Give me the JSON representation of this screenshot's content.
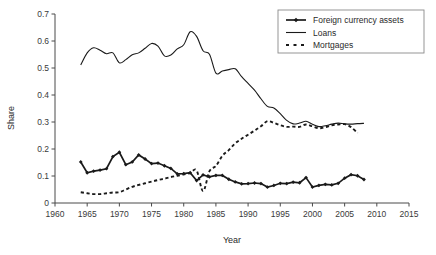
{
  "chart_data": {
    "type": "line",
    "title": "",
    "xlabel": "Year",
    "ylabel": "Share",
    "xlim": [
      1960,
      2015
    ],
    "ylim": [
      0,
      0.7
    ],
    "xticks": [
      1960,
      1965,
      1970,
      1975,
      1980,
      1985,
      1990,
      1995,
      2000,
      2005,
      2010,
      2015
    ],
    "xtick_labels": [
      "1960",
      "1965",
      "1970",
      "1975",
      "1980",
      "1985",
      "1990",
      "1995",
      "2000",
      "2005",
      "2010",
      "2015"
    ],
    "yticks": [
      0,
      0.1,
      0.2,
      0.3,
      0.4,
      0.5,
      0.6,
      0.7
    ],
    "ytick_labels": [
      "0",
      "0.1",
      "0.2",
      "0.3",
      "0.4",
      "0.5",
      "0.6",
      "0.7"
    ],
    "grid": false,
    "legend_position": "top-right",
    "series": [
      {
        "name": "Foreign currency assets",
        "style": "solid-with-markers",
        "marker": "diamond",
        "color": "#1a1a1a",
        "x": [
          1964,
          1965,
          1966,
          1967,
          1968,
          1969,
          1970,
          1971,
          1972,
          1973,
          1974,
          1975,
          1976,
          1977,
          1978,
          1979,
          1980,
          1981,
          1982,
          1983,
          1984,
          1985,
          1986,
          1987,
          1988,
          1989,
          1990,
          1991,
          1992,
          1993,
          1994,
          1995,
          1996,
          1997,
          1998,
          1999,
          2000,
          2001,
          2002,
          2003,
          2004,
          2005,
          2006,
          2007,
          2008
        ],
        "y": [
          0.152,
          0.112,
          0.118,
          0.122,
          0.127,
          0.172,
          0.188,
          0.142,
          0.152,
          0.178,
          0.163,
          0.146,
          0.148,
          0.138,
          0.128,
          0.108,
          0.109,
          0.112,
          0.083,
          0.104,
          0.097,
          0.102,
          0.102,
          0.088,
          0.078,
          0.071,
          0.072,
          0.074,
          0.072,
          0.059,
          0.065,
          0.073,
          0.072,
          0.077,
          0.075,
          0.094,
          0.059,
          0.065,
          0.069,
          0.067,
          0.073,
          0.092,
          0.105,
          0.101,
          0.087
        ]
      },
      {
        "name": "Loans",
        "style": "solid",
        "color": "#1a1a1a",
        "x": [
          1964,
          1965,
          1966,
          1967,
          1968,
          1969,
          1970,
          1971,
          1972,
          1973,
          1974,
          1975,
          1976,
          1977,
          1978,
          1979,
          1980,
          1981,
          1982,
          1983,
          1984,
          1985,
          1986,
          1987,
          1988,
          1989,
          1990,
          1991,
          1992,
          1993,
          1994,
          1995,
          1996,
          1997,
          1998,
          1999,
          2000,
          2001,
          2002,
          2003,
          2004,
          2005,
          2006,
          2007,
          2008
        ],
        "y": [
          0.511,
          0.556,
          0.575,
          0.566,
          0.553,
          0.556,
          0.519,
          0.531,
          0.549,
          0.556,
          0.573,
          0.591,
          0.581,
          0.545,
          0.548,
          0.571,
          0.586,
          0.634,
          0.617,
          0.564,
          0.551,
          0.481,
          0.489,
          0.494,
          0.497,
          0.468,
          0.443,
          0.418,
          0.386,
          0.358,
          0.352,
          0.331,
          0.306,
          0.293,
          0.296,
          0.303,
          0.292,
          0.283,
          0.286,
          0.292,
          0.296,
          0.293,
          0.292,
          0.294,
          0.295
        ]
      },
      {
        "name": "Mortgages",
        "style": "dashed",
        "color": "#1a1a1a",
        "x": [
          1964,
          1965,
          1966,
          1967,
          1968,
          1969,
          1970,
          1971,
          1972,
          1973,
          1974,
          1975,
          1976,
          1977,
          1978,
          1979,
          1980,
          1981,
          1982,
          1983,
          1984,
          1985,
          1986,
          1987,
          1988,
          1989,
          1990,
          1991,
          1992,
          1993,
          1994,
          1995,
          1996,
          1997,
          1998,
          1999,
          2000,
          2001,
          2002,
          2003,
          2004,
          2005,
          2006,
          2007
        ],
        "y": [
          0.04,
          0.036,
          0.033,
          0.033,
          0.036,
          0.039,
          0.04,
          0.05,
          0.06,
          0.067,
          0.073,
          0.079,
          0.085,
          0.09,
          0.096,
          0.101,
          0.106,
          0.111,
          0.121,
          0.044,
          0.118,
          0.137,
          0.175,
          0.196,
          0.221,
          0.238,
          0.253,
          0.268,
          0.284,
          0.303,
          0.297,
          0.288,
          0.282,
          0.283,
          0.282,
          0.291,
          0.284,
          0.277,
          0.281,
          0.288,
          0.291,
          0.292,
          0.281,
          0.259
        ]
      }
    ],
    "legend_entries": [
      {
        "label": "Foreign currency assets",
        "style": "solid-with-markers"
      },
      {
        "label": "Loans",
        "style": "solid"
      },
      {
        "label": "Mortgages",
        "style": "dashed"
      }
    ]
  }
}
